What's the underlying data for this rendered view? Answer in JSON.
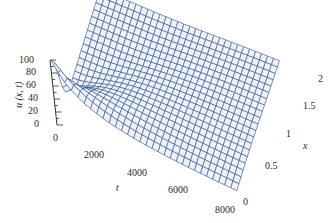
{
  "chart_data": {
    "type": "surface",
    "title": "",
    "xlabel": "t",
    "ylabel": "x",
    "zlabel": "u (x, t)",
    "t_ticks": [
      0,
      2000,
      4000,
      6000,
      8000
    ],
    "x_ticks": [
      0,
      0.5,
      1,
      1.5,
      2
    ],
    "u_ticks": [
      0,
      20,
      40,
      60,
      80,
      100
    ],
    "t_range": [
      0,
      8000
    ],
    "x_range": [
      0,
      2
    ],
    "u_range": [
      0,
      100
    ],
    "grid_t": 30,
    "grid_x": 20,
    "mesh_color": "#2f4a8a",
    "face_color": "#eef3fb"
  },
  "labels": {
    "t_axis": "t",
    "x_axis": "x",
    "u_axis": "u (x, t)",
    "t_tick_labels": [
      "0",
      "2000",
      "4000",
      "6000",
      "8000"
    ],
    "x_tick_labels": [
      "0",
      "0.5",
      "1",
      "1.5",
      "2"
    ],
    "u_tick_labels": [
      "0",
      "20",
      "40",
      "60",
      "80",
      "100"
    ]
  }
}
